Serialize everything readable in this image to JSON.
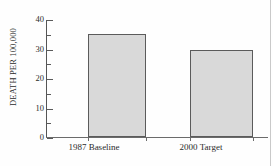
{
  "chart_data": {
    "type": "bar",
    "title": "",
    "xlabel": "",
    "ylabel": "DEATH PER 100,000",
    "categories": [
      "1987 Baseline",
      "2000 Target"
    ],
    "values": [
      35,
      29.5
    ],
    "ylim": [
      0,
      40
    ],
    "yticks": [
      0,
      10,
      20,
      30,
      40
    ],
    "ytick_labels": [
      "0",
      "10",
      "20",
      "30",
      "40"
    ],
    "yminor_ticks": [
      5,
      15,
      25,
      35
    ],
    "grid": false,
    "legend": null,
    "series": [
      {
        "name": "Death rate per 100,000",
        "values": [
          35,
          29.5
        ]
      }
    ],
    "colors": {
      "bar_fill": "#d9d9d9",
      "bar_edge": "#5b5b5b",
      "axis": "#5a5a5a",
      "text": "#2b2b2b",
      "background": "#fefefe"
    }
  }
}
